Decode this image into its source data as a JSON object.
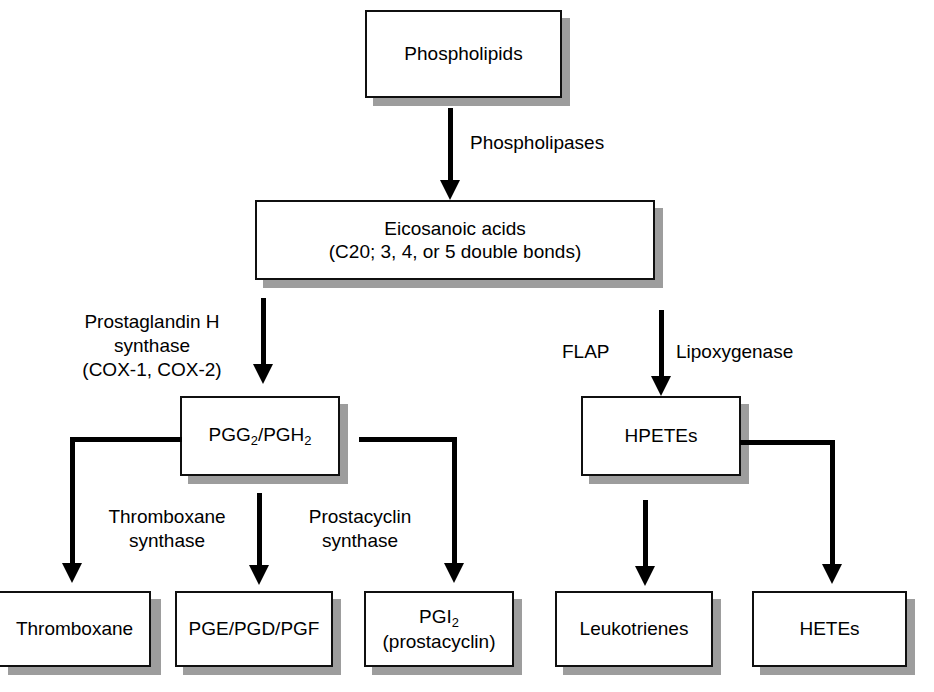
{
  "diagram": {
    "colors": {
      "box_fill": "#ffffff",
      "box_border": "#101010",
      "shadow": "#9d9d9d",
      "arrow": "#000000",
      "text": "#000000"
    },
    "nodes": {
      "phospholipids": "Phospholipids",
      "eicosanoic_line1": "Eicosanoic acids",
      "eicosanoic_line2": "(C20; 3, 4, or 5 double bonds)",
      "pgg2_pgh2_a": "PGG",
      "pgg2_pgh2_sub1": "2",
      "pgg2_pgh2_b": "/PGH",
      "pgg2_pgh2_sub2": "2",
      "hpetes": "HPETEs",
      "thromboxane": "Thromboxane",
      "pge_pgd_pgf": "PGE/PGD/PGF",
      "pgi2_main": "PGI",
      "pgi2_sub": "2",
      "pgi2_line2": "(prostacyclin)",
      "leukotrienes": "Leukotrienes",
      "hetes": "HETEs"
    },
    "edge_labels": {
      "phospholipases": "Phospholipases",
      "pgh_synthase": "Prostaglandin H\nsynthase\n(COX-1, COX-2)",
      "flap": "FLAP",
      "lipoxygenase": "Lipoxygenase",
      "thromboxane_synthase": "Thromboxane\nsynthase",
      "prostacyclin_synthase": "Prostacyclin\nsynthase"
    }
  }
}
